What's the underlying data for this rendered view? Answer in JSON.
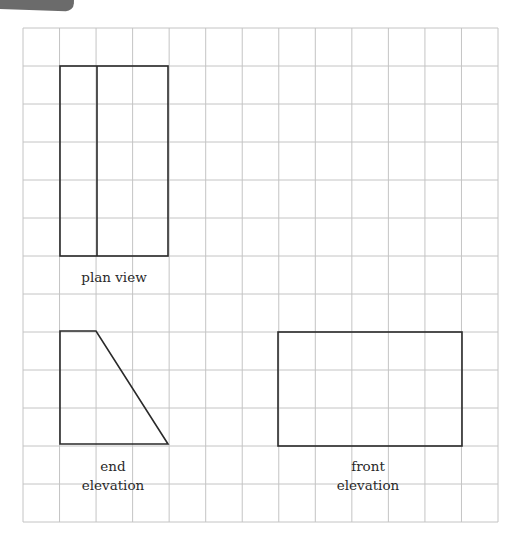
{
  "grid": {
    "left": 23,
    "top": 28,
    "right": 498,
    "bottom": 522,
    "columns": 13,
    "rows": 13,
    "line_color": "#c4c4c4"
  },
  "drawings": {
    "plan_view": {
      "label": "plan view",
      "outline": {
        "x1": 60,
        "y1": 66,
        "x2": 168,
        "y2": 256
      },
      "divider_x": 97
    },
    "end_elevation": {
      "label_line1": "end",
      "label_line2": "elevation",
      "points": "60,331 96,331 168,444 60,444"
    },
    "front_elevation": {
      "label_line1": "front",
      "label_line2": "elevation",
      "outline": {
        "x1": 278,
        "y1": 332,
        "x2": 462,
        "y2": 446
      }
    }
  },
  "colors": {
    "stroke": "#2a2a2a",
    "corner_tab": "#6b6b6b"
  }
}
